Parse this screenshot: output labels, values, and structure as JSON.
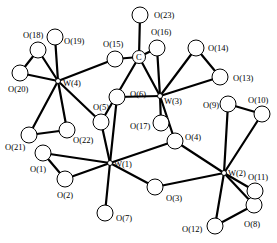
{
  "diagram": {
    "type": "molecular-structure",
    "atoms": [
      {
        "id": "W1",
        "label": "W(1)",
        "el": "W",
        "x": 110,
        "y": 163,
        "lx": 114,
        "ly": 167
      },
      {
        "id": "W2",
        "label": "W(2)",
        "el": "W",
        "x": 224,
        "y": 173,
        "lx": 228,
        "ly": 176
      },
      {
        "id": "W3",
        "label": "W(3)",
        "el": "W",
        "x": 160,
        "y": 96,
        "lx": 164,
        "ly": 104
      },
      {
        "id": "W4",
        "label": "W(4)",
        "el": "W",
        "x": 58,
        "y": 81,
        "lx": 63,
        "ly": 86
      },
      {
        "id": "C",
        "label": "C",
        "el": "C",
        "x": 139,
        "y": 57,
        "lx": 136,
        "ly": 60
      },
      {
        "id": "O1",
        "label": "O(1)",
        "el": "O",
        "x": 43,
        "y": 153,
        "lx": 30,
        "ly": 172
      },
      {
        "id": "O2",
        "label": "O(2)",
        "el": "O",
        "x": 65,
        "y": 179,
        "lx": 57,
        "ly": 198
      },
      {
        "id": "O3",
        "label": "O(3)",
        "el": "O",
        "x": 155,
        "y": 187,
        "lx": 166,
        "ly": 201
      },
      {
        "id": "O4",
        "label": "O(4)",
        "el": "O",
        "x": 175,
        "y": 141,
        "lx": 185,
        "ly": 140
      },
      {
        "id": "O5",
        "label": "O(5)",
        "el": "O",
        "x": 101,
        "y": 122,
        "lx": 93,
        "ly": 110
      },
      {
        "id": "O6",
        "label": "O(6)",
        "el": "O",
        "x": 117,
        "y": 97,
        "lx": 130,
        "ly": 97
      },
      {
        "id": "O7",
        "label": "O(7)",
        "el": "O",
        "x": 105,
        "y": 213,
        "lx": 116,
        "ly": 221
      },
      {
        "id": "O8",
        "label": "O(8)",
        "el": "O",
        "x": 254,
        "y": 205,
        "lx": 244,
        "ly": 227
      },
      {
        "id": "O9",
        "label": "O(9)",
        "el": "O",
        "x": 228,
        "y": 104,
        "lx": 203,
        "ly": 108
      },
      {
        "id": "O10",
        "label": "O(10)",
        "el": "O",
        "x": 262,
        "y": 114,
        "lx": 248,
        "ly": 103
      },
      {
        "id": "O11",
        "label": "O(11)",
        "el": "O",
        "x": 255,
        "y": 191,
        "lx": 248,
        "ly": 180
      },
      {
        "id": "O12",
        "label": "O(12)",
        "el": "O",
        "x": 215,
        "y": 226,
        "lx": 182,
        "ly": 232
      },
      {
        "id": "O13",
        "label": "O(13)",
        "el": "O",
        "x": 220,
        "y": 77,
        "lx": 233,
        "ly": 81
      },
      {
        "id": "O14",
        "label": "O(14)",
        "el": "O",
        "x": 196,
        "y": 48,
        "lx": 208,
        "ly": 51
      },
      {
        "id": "O15",
        "label": "O(15)",
        "el": "O",
        "x": 115,
        "y": 59,
        "lx": 103,
        "ly": 47
      },
      {
        "id": "O16",
        "label": "O(16)",
        "el": "O",
        "x": 157,
        "y": 48,
        "lx": 151,
        "ly": 35
      },
      {
        "id": "O17",
        "label": "O(17)",
        "el": "O",
        "x": 161,
        "y": 123,
        "lx": 130,
        "ly": 129
      },
      {
        "id": "O18",
        "label": "O(18)",
        "el": "O",
        "x": 38,
        "y": 50,
        "lx": 23,
        "ly": 38
      },
      {
        "id": "O19",
        "label": "O(19)",
        "el": "O",
        "x": 55,
        "y": 37,
        "lx": 64,
        "ly": 44
      },
      {
        "id": "O20",
        "label": "O(20)",
        "el": "O",
        "x": 20,
        "y": 73,
        "lx": 8,
        "ly": 92
      },
      {
        "id": "O21",
        "label": "O(21)",
        "el": "O",
        "x": 29,
        "y": 135,
        "lx": 5,
        "ly": 150
      },
      {
        "id": "O22",
        "label": "O(22)",
        "el": "O",
        "x": 67,
        "y": 130,
        "lx": 73,
        "ly": 143
      },
      {
        "id": "O23",
        "label": "O(23)",
        "el": "O",
        "x": 140,
        "y": 15,
        "lx": 154,
        "ly": 18
      }
    ],
    "bonds": [
      [
        "W1",
        "O1"
      ],
      [
        "W1",
        "O2"
      ],
      [
        "W1",
        "O3"
      ],
      [
        "W1",
        "O4"
      ],
      [
        "W1",
        "O5"
      ],
      [
        "W1",
        "O6"
      ],
      [
        "W1",
        "O7"
      ],
      [
        "O1",
        "O2"
      ],
      [
        "W2",
        "O3"
      ],
      [
        "W2",
        "O4"
      ],
      [
        "W2",
        "O9"
      ],
      [
        "W2",
        "O10"
      ],
      [
        "W2",
        "O11"
      ],
      [
        "W2",
        "O8"
      ],
      [
        "W2",
        "O12"
      ],
      [
        "O9",
        "O10"
      ],
      [
        "O12",
        "O8"
      ],
      [
        "W3",
        "O6"
      ],
      [
        "W3",
        "O13"
      ],
      [
        "W3",
        "O14"
      ],
      [
        "W3",
        "O16"
      ],
      [
        "W3",
        "O17"
      ],
      [
        "W3",
        "O4"
      ],
      [
        "W3",
        "C"
      ],
      [
        "O13",
        "O14"
      ],
      [
        "C",
        "O16"
      ],
      [
        "C",
        "O23"
      ],
      [
        "C",
        "O5"
      ],
      [
        "W4",
        "O15"
      ],
      [
        "W4",
        "O18"
      ],
      [
        "W4",
        "O19"
      ],
      [
        "W4",
        "O20"
      ],
      [
        "W4",
        "O21"
      ],
      [
        "W4",
        "O22"
      ],
      [
        "W4",
        "O5"
      ],
      [
        "O18",
        "O20"
      ],
      [
        "O21",
        "O22"
      ],
      [
        "O15",
        "C"
      ]
    ]
  }
}
